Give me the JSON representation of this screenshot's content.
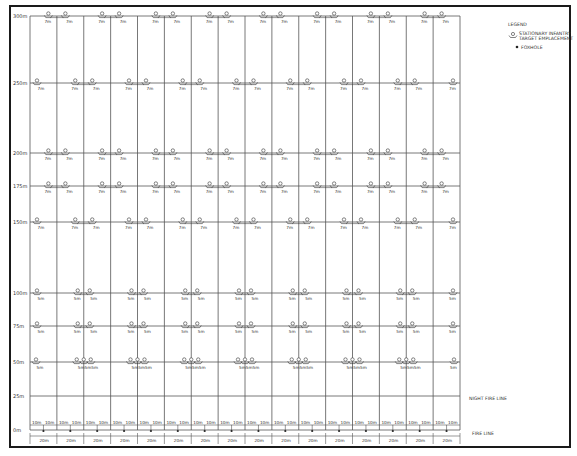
{
  "legend": {
    "heading": "LEGEND",
    "items": [
      {
        "icon": "target-emplacement-icon",
        "label_line1": "STATIONARY INFANTRY",
        "label_line2": "TARGET EMPLACEMENT"
      },
      {
        "icon": "foxhole-icon",
        "label": "FOXHOLE"
      }
    ]
  },
  "lines": {
    "night_fire_line": "NIGHT FIRE LINE",
    "fire_line": "FIRE LINE"
  },
  "lane_count": 16,
  "ranges": [
    {
      "label": "300m",
      "meters": 300,
      "pattern": "pairs-even",
      "spacing_label": "7m"
    },
    {
      "label": "250m",
      "meters": 250,
      "pattern": "pairs-odd",
      "spacing_label": "7m"
    },
    {
      "label": "200m",
      "meters": 200,
      "pattern": "pairs-even",
      "spacing_label": "7m"
    },
    {
      "label": "175m",
      "meters": 175,
      "pattern": "pairs-even",
      "spacing_label": "7m"
    },
    {
      "label": "150m",
      "meters": 150,
      "pattern": "pairs-odd",
      "spacing_label": "7m"
    },
    {
      "label": "100m",
      "meters": 100,
      "pattern": "pairs-odd-wide",
      "spacing_label": "5m"
    },
    {
      "label": "75m",
      "meters": 75,
      "pattern": "pairs-odd-wide",
      "spacing_label": "5m"
    },
    {
      "label": "50m",
      "meters": 50,
      "pattern": "triples",
      "spacing_label": "5m"
    },
    {
      "label": "25m",
      "meters": 25,
      "pattern": "none",
      "spacing_label": ""
    },
    {
      "label": "0m",
      "meters": 0,
      "pattern": "fire-line",
      "spacing_label": ""
    }
  ],
  "fire_line_dims": {
    "half_lane_label": "10m",
    "lane_width_label": "20m"
  }
}
